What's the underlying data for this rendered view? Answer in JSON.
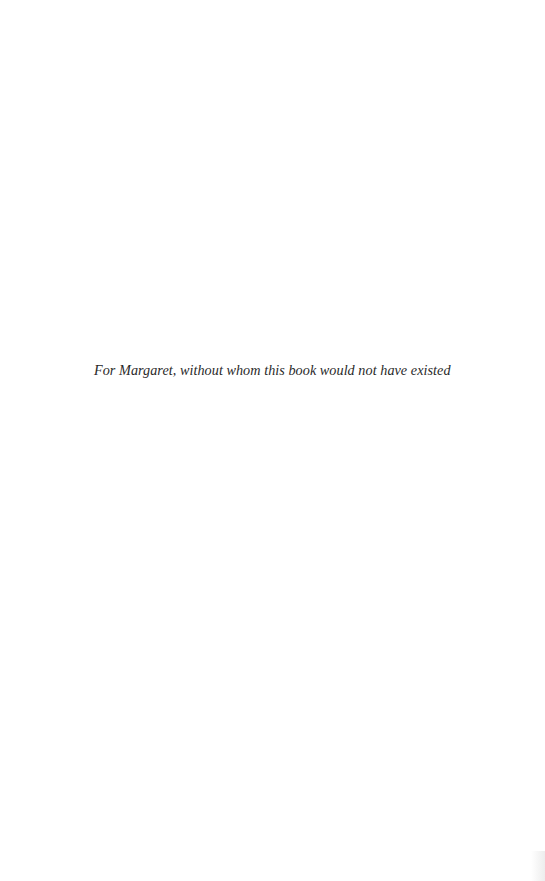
{
  "page": {
    "type": "dedication",
    "dedication_text": "For Margaret, without whom this book would not have existed"
  },
  "colors": {
    "background": "#ffffff",
    "text": "#2a2a2a"
  }
}
